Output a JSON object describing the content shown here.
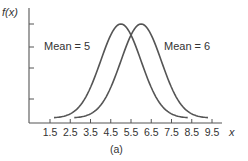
{
  "chart_data": {
    "type": "line",
    "title": "",
    "caption": "(a)",
    "xlabel": "x",
    "ylabel": "f(x)",
    "x_ticks": [
      1.5,
      2.5,
      3.5,
      4.5,
      5.5,
      6.5,
      7.5,
      8.5,
      9.5
    ],
    "x_tick_labels": [
      "1.5",
      "2.5",
      "3.5",
      "4.5",
      "5.5",
      "6.5",
      "7.5",
      "8.5",
      "9.5"
    ],
    "xlim": [
      0.5,
      10.5
    ],
    "y_tick_count": 4,
    "grid": false,
    "series": [
      {
        "name": "Mean = 5",
        "distribution": "normal",
        "mean": 5,
        "sd": 1.0,
        "x_range": [
          1.7,
          8.3
        ]
      },
      {
        "name": "Mean = 6",
        "distribution": "normal",
        "mean": 6,
        "sd": 1.0,
        "x_range": [
          2.7,
          9.3
        ]
      }
    ],
    "annotations": [
      {
        "text": "Mean = 5",
        "near": "left of left curve"
      },
      {
        "text": "Mean = 6",
        "near": "right of right curve"
      }
    ]
  }
}
